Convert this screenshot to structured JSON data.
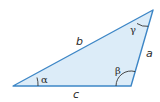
{
  "diagram": {
    "type": "triangle",
    "colors": {
      "fill": "#dcecf8",
      "stroke": "#3d86c6",
      "arc": "#333333",
      "text": "#2a2a2a"
    },
    "vertices": {
      "left": [
        13,
        86
      ],
      "right": [
        131,
        86
      ],
      "top": [
        153,
        10
      ]
    },
    "sides": {
      "a": "a",
      "b": "b",
      "c": "c"
    },
    "angles": {
      "alpha": "α",
      "beta": "β",
      "gamma": "γ"
    }
  }
}
